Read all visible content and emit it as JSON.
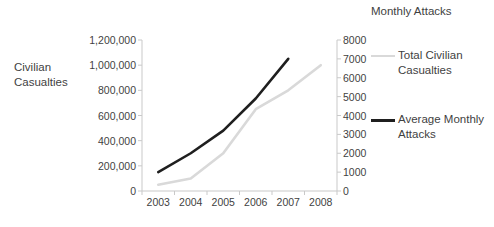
{
  "chart_data": {
    "type": "line",
    "title": "",
    "xlabel": "",
    "categories": [
      "2003",
      "2004",
      "2005",
      "2006",
      "2007",
      "2008"
    ],
    "grid": false,
    "legend_position": "right",
    "axes": {
      "left": {
        "label": "Civilian Casualties",
        "ylim": [
          0,
          1200000
        ],
        "ticks": [
          "0",
          "200,000",
          "400,000",
          "600,000",
          "800,000",
          "1,000,000",
          "1,200,000"
        ],
        "tick_values": [
          0,
          200000,
          400000,
          600000,
          800000,
          1000000,
          1200000
        ]
      },
      "right": {
        "label": "Monthly Attacks",
        "ylim": [
          0,
          8000
        ],
        "ticks": [
          "0",
          "1000",
          "2000",
          "3000",
          "4000",
          "5000",
          "6000",
          "7000",
          "8000"
        ],
        "tick_values": [
          0,
          1000,
          2000,
          3000,
          4000,
          5000,
          6000,
          7000,
          8000
        ]
      }
    },
    "series": [
      {
        "name": "Total Civilian Casualties",
        "axis": "left",
        "color": "#d9d9d9",
        "width": 2.6,
        "x": [
          "2003",
          "2004",
          "2005",
          "2006",
          "2007",
          "2008"
        ],
        "values": [
          50000,
          100000,
          300000,
          650000,
          800000,
          1000000
        ]
      },
      {
        "name": "Average Monthly Attacks",
        "axis": "right",
        "color": "#1f1f1f",
        "width": 2.6,
        "x": [
          "2003",
          "2004",
          "2005",
          "2006",
          "2007"
        ],
        "values": [
          1000,
          2000,
          3200,
          4900,
          7000
        ]
      }
    ]
  },
  "labels": {
    "left_axis_title": "Civilian Casualties",
    "right_axis_title": "Monthly Attacks"
  },
  "legend": {
    "entries": [
      {
        "label": "Total Civilian Casualties",
        "color": "#d9d9d9"
      },
      {
        "label": "Average Monthly Attacks",
        "color": "#1f1f1f"
      }
    ]
  },
  "colors": {
    "axis": "#c9c9c9",
    "text": "#3f3f3f",
    "series_light": "#d9d9d9",
    "series_dark": "#1f1f1f",
    "background": "#ffffff"
  }
}
